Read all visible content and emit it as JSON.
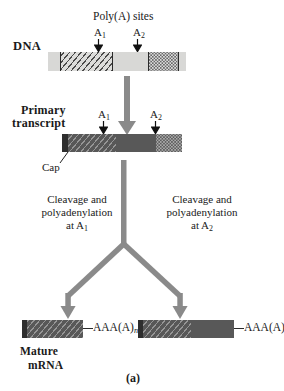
{
  "figure": {
    "panel_label": "(a)",
    "caption_title": "Poly(A) sites"
  },
  "dna_stage": {
    "row_label": "DNA",
    "site_1_label": "A",
    "site_1_sub": "1",
    "site_2_label": "A",
    "site_2_sub": "2",
    "segments": [
      {
        "name": "flank-left",
        "fill": "light",
        "x": 48,
        "w": 12
      },
      {
        "name": "exon-hatched",
        "fill": "light-hatch",
        "x": 60,
        "w": 52
      },
      {
        "name": "intron-plain",
        "fill": "light",
        "x": 112,
        "w": 36
      },
      {
        "name": "exon-stipple",
        "fill": "light-stipple",
        "x": 148,
        "w": 30
      },
      {
        "name": "flank-right",
        "fill": "light",
        "x": 178,
        "w": 8
      }
    ]
  },
  "transcript_stage": {
    "row_label_line1": "Primary",
    "row_label_line2": "transcript",
    "cap_label": "Cap",
    "site_1_label": "A",
    "site_1_sub": "1",
    "site_2_label": "A",
    "site_2_sub": "2",
    "segments": [
      {
        "name": "cap",
        "fill": "cap",
        "x": 62,
        "w": 6
      },
      {
        "name": "exon-hatched",
        "fill": "dark-hatch",
        "x": 68,
        "w": 48
      },
      {
        "name": "intron-dark",
        "fill": "dark",
        "x": 116,
        "w": 40
      },
      {
        "name": "exon-stipple",
        "fill": "dark-stipple",
        "x": 156,
        "w": 26
      }
    ]
  },
  "processing": {
    "left": {
      "line1": "Cleavage and",
      "line2": "polyadenylation",
      "line3_prefix": "at A",
      "line3_sub": "1"
    },
    "right": {
      "line1": "Cleavage and",
      "line2": "polyadenylation",
      "line3_prefix": "at A",
      "line3_sub": "2"
    }
  },
  "mature_stage": {
    "row_label_line1": "Mature",
    "row_label_line2": "mRNA",
    "poly_a_tail_text": "AAA(A)",
    "poly_a_tail_sub": "n",
    "product_left": {
      "name": "short-mrna",
      "segments": [
        {
          "name": "cap",
          "fill": "cap",
          "x": 22,
          "w": 5
        },
        {
          "name": "exon-hatched",
          "fill": "dark-hatch",
          "x": 27,
          "w": 56
        }
      ],
      "tail_label": "AAA(A)",
      "tail_sub": "n"
    },
    "product_right": {
      "name": "long-mrna",
      "segments": [
        {
          "name": "cap",
          "fill": "cap",
          "x": 138,
          "w": 5
        },
        {
          "name": "exon-hatched",
          "fill": "dark-hatch",
          "x": 143,
          "w": 48
        },
        {
          "name": "exon-dark",
          "fill": "dark",
          "x": 191,
          "w": 43
        }
      ],
      "tail_label": "AAA(A)",
      "tail_sub": "n"
    }
  },
  "colors": {
    "arrow_gray": "#8a8a8a",
    "dark_fill": "#585858",
    "light_fill": "#d8d8d6",
    "cap_fill": "#2e2e2e",
    "text": "#1a1a1a"
  }
}
